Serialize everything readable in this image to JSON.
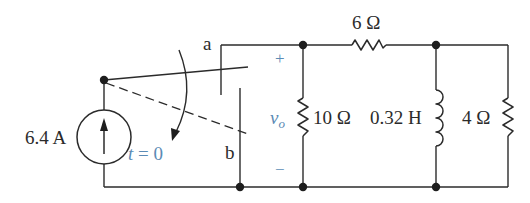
{
  "diagram": {
    "type": "circuit-schematic",
    "accent_color": "#5b8bb5",
    "line_color": "#2b2b2b",
    "source": {
      "kind": "current-source",
      "value_label": "6.4 A",
      "direction": "up"
    },
    "switch": {
      "kind": "SPDT switch",
      "terminal_a_label": "a",
      "terminal_b_label": "b",
      "time_label": "t = 0",
      "action": "moves from a to b at t = 0"
    },
    "output_voltage": {
      "symbol": "v",
      "subscript": "o",
      "plus_label": "+",
      "minus_label": "−"
    },
    "components": {
      "r_series": {
        "value_label": "6 Ω"
      },
      "r_shunt": {
        "value_label": "10 Ω"
      },
      "inductor": {
        "value_label": "0.32 H"
      },
      "r_load": {
        "value_label": "4 Ω"
      }
    }
  }
}
